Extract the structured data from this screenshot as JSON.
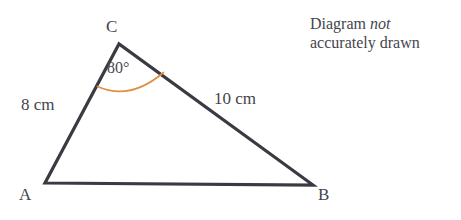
{
  "canvas": {
    "width": 461,
    "height": 220,
    "background": "#ffffff"
  },
  "colors": {
    "stroke": "#3a3a42",
    "text": "#44444c",
    "arc": "#e0903f"
  },
  "figure": {
    "shape": "triangle",
    "vertices": {
      "a": {
        "label": "A",
        "x": 45,
        "y": 183
      },
      "b": {
        "label": "B",
        "x": 313,
        "y": 185
      },
      "c": {
        "label": "C",
        "x": 119,
        "y": 44
      }
    },
    "sides": [
      {
        "name": "ac",
        "label": "8 cm",
        "value": 8,
        "unit": "cm"
      },
      {
        "name": "cb",
        "label": "10 cm",
        "value": 10,
        "unit": "cm"
      },
      {
        "name": "ab",
        "label": "",
        "value": null,
        "unit": ""
      }
    ],
    "angles": [
      {
        "at": "c",
        "label": "80°",
        "value": 80,
        "unit": "degrees",
        "marker": "arc"
      }
    ]
  },
  "note": {
    "line1_prefix": "Diagram ",
    "line1_emphasis": "not",
    "line2": "accurately drawn"
  }
}
